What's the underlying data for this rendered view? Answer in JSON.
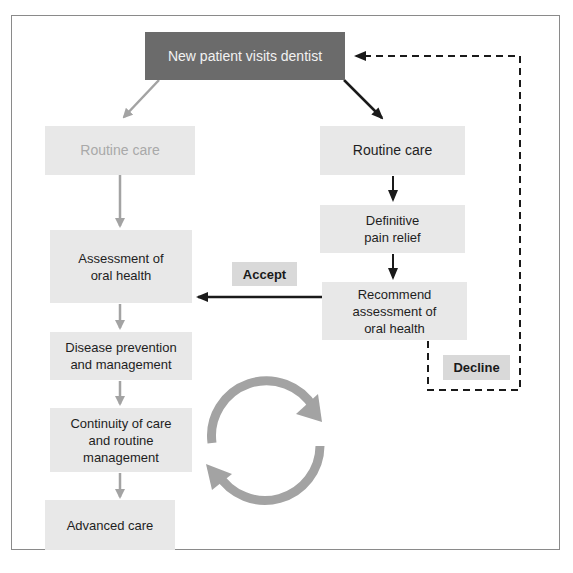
{
  "diagram": {
    "start": {
      "label": "New patient visits dentist"
    },
    "left_branch": {
      "routine_care": "Routine care",
      "assessment": "Assessment of\noral health",
      "prevention": "Disease prevention\nand management",
      "continuity": "Continuity of care\nand routine\nmanagement",
      "advanced": "Advanced care"
    },
    "right_branch": {
      "routine_care": "Routine care",
      "pain_relief": "Definitive\npain relief",
      "recommend": "Recommend\nassessment of\noral health"
    },
    "edges": {
      "accept_label": "Accept",
      "decline_label": "Decline"
    },
    "cycle_icon": "refresh-cycle-icon",
    "colors": {
      "start_box": "#6b6b6b",
      "box": "#e8e8e8",
      "faded_text": "#a9a9a9",
      "gray_arrow": "#a3a3a3",
      "dark_arrow": "#1a1a1a"
    }
  }
}
